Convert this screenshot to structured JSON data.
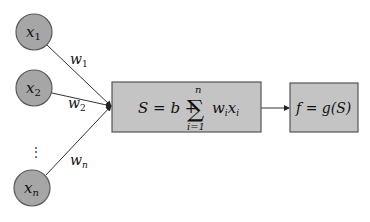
{
  "diagram": {
    "inputs": [
      {
        "id": "x1",
        "var": "x",
        "sub": "1",
        "weight_var": "w",
        "weight_sub": "1"
      },
      {
        "id": "x2",
        "var": "x",
        "sub": "2",
        "weight_var": "w",
        "weight_sub": "2"
      },
      {
        "id": "xn",
        "var": "x",
        "sub": "n",
        "weight_var": "w",
        "weight_sub": "n"
      }
    ],
    "ellipsis": "⋮",
    "sum_block": {
      "lhs": "S = b + ",
      "sigma": "∑",
      "upper": "n",
      "lower": "i=1",
      "term_w": "w",
      "term_w_sub": "i",
      "term_x": "x",
      "term_x_sub": "i"
    },
    "activation_block": {
      "label": "f = g(S)"
    },
    "colors": {
      "node_fill": "#a6a6a6",
      "box_fill": "#c4c4c4",
      "stroke": "#555555"
    }
  }
}
